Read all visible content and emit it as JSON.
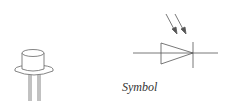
{
  "caption": "Symbol",
  "components": [
    {
      "name": "photodiode-package",
      "type": "TO-can with two leads"
    },
    {
      "name": "photodiode-symbol",
      "type": "diode with two incoming light arrows"
    }
  ],
  "colors": {
    "stroke": "#555555",
    "background": "#ffffff"
  }
}
